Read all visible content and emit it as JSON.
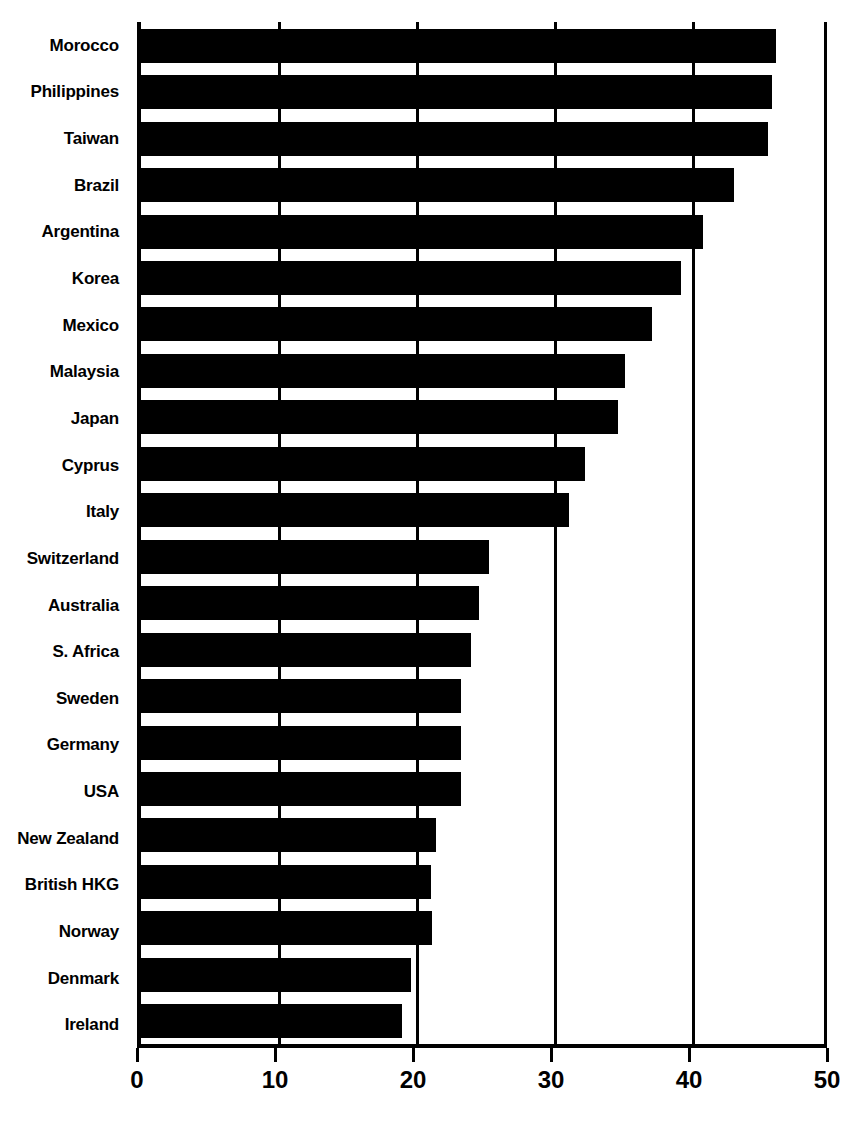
{
  "chart_data": {
    "type": "bar",
    "orientation": "horizontal",
    "title": "",
    "subtitle": "",
    "xlabel": "",
    "ylabel": "",
    "xlim": [
      0,
      50
    ],
    "xticks": [
      0,
      10,
      20,
      30,
      40,
      50
    ],
    "xticklabels": [
      "0",
      "10",
      "20",
      "30",
      "40",
      "50"
    ],
    "grid": true,
    "grid_axis": "x",
    "legend": null,
    "bar_color": "#000000",
    "background_color": "#ffffff",
    "axis_color": "#000000",
    "categories": [
      "Morocco",
      "Philippines",
      "Taiwan",
      "Brazil",
      "Argentina",
      "Korea",
      "Mexico",
      "Malaysia",
      "Japan",
      "Cyprus",
      "Italy",
      "Switzerland",
      "Australia",
      "S. Africa",
      "Sweden",
      "Germany",
      "USA",
      "New Zealand",
      "British HKG",
      "Norway",
      "Denmark",
      "Ireland"
    ],
    "values": [
      46.0,
      45.7,
      45.4,
      43.0,
      40.7,
      39.1,
      37.0,
      35.1,
      34.6,
      32.2,
      31.0,
      25.2,
      24.5,
      23.9,
      23.2,
      23.2,
      23.2,
      21.4,
      21.0,
      21.1,
      19.6,
      18.9
    ]
  }
}
